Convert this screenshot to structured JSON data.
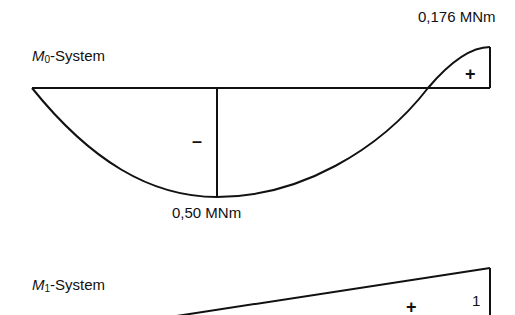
{
  "m0_system": {
    "title_italic": "M",
    "title_sub": "0",
    "title_rest": "-System",
    "max_positive_label": "0,176 MNm",
    "max_negative_label": "0,50 MNm",
    "positive_sign": "+",
    "negative_sign": "–"
  },
  "m1_system": {
    "title_italic": "M",
    "title_sub": "1",
    "title_rest": "-System",
    "positive_sign": "+",
    "end_value": "1"
  },
  "colors": {
    "line": "#111111",
    "background": "#ffffff"
  }
}
